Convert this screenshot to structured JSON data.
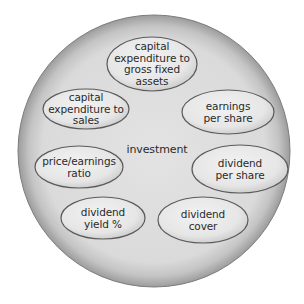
{
  "diagram": {
    "type": "circle-with-ellipses",
    "outer_circle": {
      "center": [
        154,
        151
      ],
      "radius": 136,
      "rim_color": "#9a9a9a",
      "fill_color": "#d8d8d8",
      "inner_fill_color": "#e2e2e2"
    },
    "center_label": "investment",
    "ellipse_fill": "#ededed",
    "ellipse_stroke": "#5a5a5a",
    "text_color": "#2a2a2a",
    "nodes": [
      {
        "id": "capex-gross-fixed-assets",
        "lines": [
          "capital",
          "expenditure to",
          "gross fixed",
          "assets"
        ],
        "cx": 152,
        "cy": 64,
        "rx": 45,
        "ry": 27
      },
      {
        "id": "capex-sales",
        "lines": [
          "capital",
          "expenditure to",
          "sales"
        ],
        "cx": 86,
        "cy": 109,
        "rx": 43,
        "ry": 20
      },
      {
        "id": "earnings-per-share",
        "lines": [
          "earnings",
          "per share"
        ],
        "cx": 228,
        "cy": 112,
        "rx": 46,
        "ry": 22
      },
      {
        "id": "price-earnings-ratio",
        "lines": [
          "price/earnings",
          "ratio"
        ],
        "cx": 79,
        "cy": 167,
        "rx": 44,
        "ry": 21
      },
      {
        "id": "dividend-per-share",
        "lines": [
          "dividend",
          "per share"
        ],
        "cx": 240,
        "cy": 169,
        "rx": 48,
        "ry": 24
      },
      {
        "id": "dividend-yield",
        "lines": [
          "dividend",
          "yield %"
        ],
        "cx": 103,
        "cy": 218,
        "rx": 42,
        "ry": 21
      },
      {
        "id": "dividend-cover",
        "lines": [
          "dividend",
          "cover"
        ],
        "cx": 203,
        "cy": 220,
        "rx": 45,
        "ry": 23
      }
    ]
  }
}
